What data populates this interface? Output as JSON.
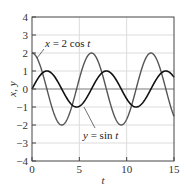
{
  "chart_data": {
    "type": "line",
    "title": "",
    "xlabel": "t",
    "ylabel": "x, y",
    "xlim": [
      0,
      15
    ],
    "ylim": [
      -4,
      4
    ],
    "xticks": [
      0,
      5,
      10,
      15
    ],
    "yticks": [
      -4,
      -3,
      -2,
      -1,
      0,
      1,
      2,
      3,
      4
    ],
    "xtick_labels": [
      "0",
      "5",
      "10",
      "15"
    ],
    "ytick_labels": [
      "−4",
      "−3",
      "−2",
      "−1",
      "0",
      "1",
      "2",
      "3",
      "4"
    ],
    "grid": true,
    "legend": "none (inline annotations)",
    "series": [
      {
        "name": "x = 2 cos t",
        "function": "2*cos(t)",
        "color": "#555555",
        "x": [
          0,
          1.57,
          3.14,
          4.71,
          6.28,
          7.85,
          9.42,
          11.0,
          12.57,
          14.14,
          15
        ],
        "values": [
          2,
          0,
          -2,
          0,
          2,
          0,
          -2,
          0,
          2,
          0,
          -1.52
        ]
      },
      {
        "name": "y = sin t",
        "function": "sin(t)",
        "color": "#111111",
        "x": [
          0,
          1.57,
          3.14,
          4.71,
          6.28,
          7.85,
          9.42,
          11.0,
          12.57,
          14.14,
          15
        ],
        "values": [
          0,
          1,
          0,
          -1,
          0,
          1,
          0,
          -1,
          0,
          1,
          0.65
        ]
      }
    ],
    "annotations": [
      {
        "text_main": "x",
        "text_rest": " = 2 cos ",
        "text_var": "t",
        "points_to": "x = 2 cos t curve"
      },
      {
        "text_main": "y",
        "text_rest": " = sin ",
        "text_var": "t",
        "points_to": "y = sin t curve"
      }
    ]
  },
  "axes": {
    "xlabel": "t",
    "ylabel": "x, y"
  }
}
